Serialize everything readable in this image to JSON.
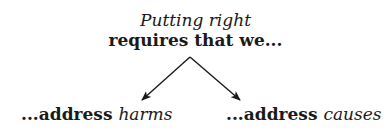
{
  "header": {
    "line1": "Putting right",
    "line2": "requires that we..."
  },
  "branches": [
    {
      "prefix": "...address ",
      "emphasis": "harms"
    },
    {
      "prefix": "...address ",
      "emphasis": "causes"
    }
  ],
  "colors": {
    "text": "#1a1a1a",
    "arrow": "#1a1a1a",
    "background": "#ffffff"
  }
}
